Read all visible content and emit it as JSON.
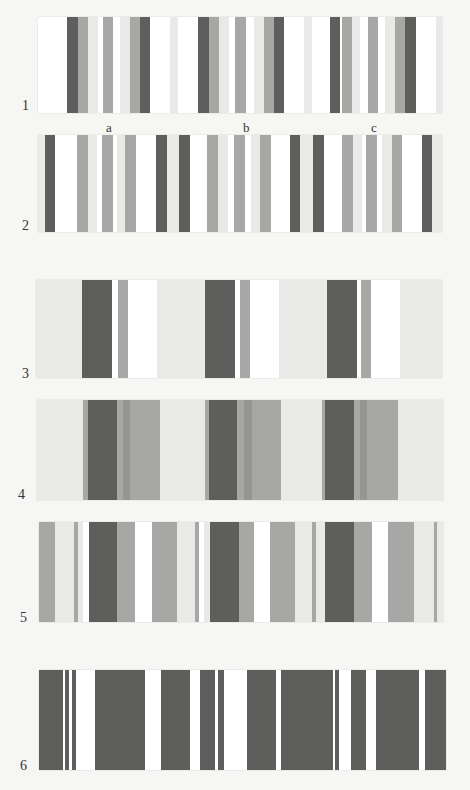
{
  "colors": {
    "white": "#ffffff",
    "light": "#e9e9e7",
    "mid": "#a7a7a5",
    "mid2": "#959593",
    "dark": "#5e5e5c"
  },
  "group_labels": [
    {
      "text": "a",
      "x": 106,
      "y": 120
    },
    {
      "text": "b",
      "x": 243,
      "y": 120
    },
    {
      "text": "c",
      "x": 371,
      "y": 120
    }
  ],
  "panels": [
    {
      "label": "1",
      "label_x": 22,
      "label_y": 98,
      "x": 38,
      "y": 17,
      "w": 404,
      "h": 96,
      "stripes": [
        [
          38,
          67,
          "white"
        ],
        [
          67,
          78,
          "dark"
        ],
        [
          78,
          88,
          "mid"
        ],
        [
          88,
          98,
          "light"
        ],
        [
          98,
          103,
          "white"
        ],
        [
          103,
          113,
          "mid"
        ],
        [
          113,
          120,
          "white"
        ],
        [
          120,
          130,
          "light"
        ],
        [
          130,
          140,
          "mid"
        ],
        [
          140,
          150,
          "dark"
        ],
        [
          150,
          170,
          "white"
        ],
        [
          170,
          178,
          "light"
        ],
        [
          178,
          198,
          "white"
        ],
        [
          198,
          209,
          "dark"
        ],
        [
          209,
          219,
          "mid"
        ],
        [
          219,
          229,
          "light"
        ],
        [
          229,
          235,
          "white"
        ],
        [
          235,
          246,
          "mid"
        ],
        [
          246,
          254,
          "white"
        ],
        [
          254,
          264,
          "light"
        ],
        [
          264,
          274,
          "mid"
        ],
        [
          274,
          284,
          "dark"
        ],
        [
          284,
          304,
          "white"
        ],
        [
          304,
          312,
          "light"
        ],
        [
          312,
          330,
          "white"
        ],
        [
          330,
          340,
          "dark"
        ],
        [
          340,
          342,
          "white"
        ],
        [
          342,
          352,
          "mid"
        ],
        [
          352,
          360,
          "light"
        ],
        [
          360,
          368,
          "white"
        ],
        [
          368,
          378,
          "mid"
        ],
        [
          378,
          385,
          "white"
        ],
        [
          385,
          395,
          "light"
        ],
        [
          395,
          405,
          "mid"
        ],
        [
          405,
          416,
          "dark"
        ],
        [
          416,
          436,
          "white"
        ],
        [
          436,
          442,
          "light"
        ]
      ]
    },
    {
      "label": "2",
      "label_x": 22,
      "label_y": 218,
      "x": 38,
      "y": 135,
      "w": 404,
      "h": 97,
      "stripes": [
        [
          38,
          45,
          "light"
        ],
        [
          45,
          55,
          "dark"
        ],
        [
          55,
          77,
          "white"
        ],
        [
          77,
          88,
          "mid"
        ],
        [
          88,
          97,
          "light"
        ],
        [
          97,
          102,
          "white"
        ],
        [
          102,
          113,
          "mid"
        ],
        [
          113,
          117,
          "white"
        ],
        [
          117,
          125,
          "light"
        ],
        [
          125,
          136,
          "mid"
        ],
        [
          136,
          156,
          "white"
        ],
        [
          156,
          167,
          "dark"
        ],
        [
          167,
          179,
          "light"
        ],
        [
          179,
          190,
          "dark"
        ],
        [
          190,
          207,
          "white"
        ],
        [
          207,
          218,
          "mid"
        ],
        [
          218,
          228,
          "light"
        ],
        [
          228,
          234,
          "white"
        ],
        [
          234,
          245,
          "mid"
        ],
        [
          245,
          251,
          "white"
        ],
        [
          251,
          260,
          "light"
        ],
        [
          260,
          271,
          "mid"
        ],
        [
          271,
          290,
          "white"
        ],
        [
          290,
          300,
          "dark"
        ],
        [
          300,
          313,
          "light"
        ],
        [
          313,
          324,
          "dark"
        ],
        [
          324,
          342,
          "white"
        ],
        [
          342,
          353,
          "mid"
        ],
        [
          353,
          362,
          "light"
        ],
        [
          362,
          366,
          "white"
        ],
        [
          366,
          377,
          "mid"
        ],
        [
          377,
          382,
          "white"
        ],
        [
          382,
          392,
          "light"
        ],
        [
          392,
          402,
          "mid"
        ],
        [
          402,
          422,
          "white"
        ],
        [
          422,
          432,
          "dark"
        ],
        [
          432,
          442,
          "light"
        ]
      ]
    },
    {
      "label": "3",
      "label_x": 22,
      "label_y": 366,
      "x": 36,
      "y": 280,
      "w": 406,
      "h": 98,
      "stripes": [
        [
          36,
          82,
          "light"
        ],
        [
          82,
          112,
          "dark"
        ],
        [
          112,
          118,
          "white"
        ],
        [
          118,
          128,
          "mid"
        ],
        [
          128,
          157,
          "white"
        ],
        [
          157,
          205,
          "light"
        ],
        [
          205,
          235,
          "dark"
        ],
        [
          235,
          240,
          "white"
        ],
        [
          240,
          250,
          "mid"
        ],
        [
          250,
          279,
          "white"
        ],
        [
          279,
          327,
          "light"
        ],
        [
          327,
          357,
          "dark"
        ],
        [
          357,
          361,
          "white"
        ],
        [
          361,
          371,
          "mid"
        ],
        [
          371,
          400,
          "white"
        ],
        [
          400,
          442,
          "light"
        ]
      ]
    },
    {
      "label": "4",
      "label_x": 18,
      "label_y": 487,
      "x": 37,
      "y": 400,
      "w": 406,
      "h": 100,
      "stripes": [
        [
          37,
          83,
          "light"
        ],
        [
          83,
          88,
          "mid"
        ],
        [
          88,
          117,
          "dark"
        ],
        [
          117,
          123,
          "mid"
        ],
        [
          123,
          130,
          "mid2"
        ],
        [
          130,
          160,
          "mid"
        ],
        [
          160,
          205,
          "light"
        ],
        [
          205,
          209,
          "mid"
        ],
        [
          209,
          237,
          "dark"
        ],
        [
          237,
          244,
          "mid"
        ],
        [
          244,
          252,
          "mid2"
        ],
        [
          252,
          281,
          "mid"
        ],
        [
          281,
          322,
          "light"
        ],
        [
          322,
          325,
          "mid"
        ],
        [
          325,
          354,
          "dark"
        ],
        [
          354,
          360,
          "mid"
        ],
        [
          360,
          367,
          "mid2"
        ],
        [
          367,
          398,
          "mid"
        ],
        [
          398,
          443,
          "light"
        ]
      ]
    },
    {
      "label": "5",
      "label_x": 20,
      "label_y": 610,
      "x": 39,
      "y": 522,
      "w": 404,
      "h": 100,
      "stripes": [
        [
          39,
          55,
          "mid"
        ],
        [
          55,
          74,
          "light"
        ],
        [
          74,
          78,
          "mid"
        ],
        [
          78,
          83,
          "light"
        ],
        [
          83,
          89,
          "white"
        ],
        [
          89,
          117,
          "dark"
        ],
        [
          117,
          135,
          "mid"
        ],
        [
          135,
          152,
          "white"
        ],
        [
          152,
          177,
          "mid"
        ],
        [
          177,
          195,
          "light"
        ],
        [
          195,
          199,
          "mid"
        ],
        [
          199,
          204,
          "white"
        ],
        [
          204,
          210,
          "light"
        ],
        [
          210,
          239,
          "dark"
        ],
        [
          239,
          254,
          "mid"
        ],
        [
          254,
          270,
          "white"
        ],
        [
          270,
          295,
          "mid"
        ],
        [
          295,
          312,
          "light"
        ],
        [
          312,
          316,
          "mid"
        ],
        [
          316,
          325,
          "light"
        ],
        [
          325,
          354,
          "dark"
        ],
        [
          354,
          372,
          "mid"
        ],
        [
          372,
          388,
          "white"
        ],
        [
          388,
          414,
          "mid"
        ],
        [
          414,
          434,
          "light"
        ],
        [
          434,
          437,
          "mid"
        ],
        [
          437,
          443,
          "light"
        ]
      ]
    },
    {
      "label": "6",
      "label_x": 20,
      "label_y": 758,
      "x": 39,
      "y": 670,
      "w": 407,
      "h": 100,
      "stripes": [
        [
          39,
          63,
          "dark"
        ],
        [
          63,
          65,
          "white"
        ],
        [
          65,
          69,
          "dark"
        ],
        [
          69,
          72,
          "white"
        ],
        [
          72,
          76,
          "dark"
        ],
        [
          76,
          95,
          "white"
        ],
        [
          95,
          145,
          "dark"
        ],
        [
          145,
          161,
          "white"
        ],
        [
          161,
          190,
          "dark"
        ],
        [
          190,
          200,
          "white"
        ],
        [
          200,
          215,
          "dark"
        ],
        [
          215,
          218,
          "white"
        ],
        [
          218,
          224,
          "dark"
        ],
        [
          224,
          247,
          "white"
        ],
        [
          247,
          276,
          "dark"
        ],
        [
          276,
          281,
          "white"
        ],
        [
          281,
          333,
          "dark"
        ],
        [
          333,
          335,
          "white"
        ],
        [
          335,
          339,
          "dark"
        ],
        [
          339,
          351,
          "white"
        ],
        [
          351,
          366,
          "dark"
        ],
        [
          366,
          376,
          "white"
        ],
        [
          376,
          419,
          "dark"
        ],
        [
          419,
          425,
          "white"
        ],
        [
          425,
          446,
          "dark"
        ]
      ]
    }
  ]
}
